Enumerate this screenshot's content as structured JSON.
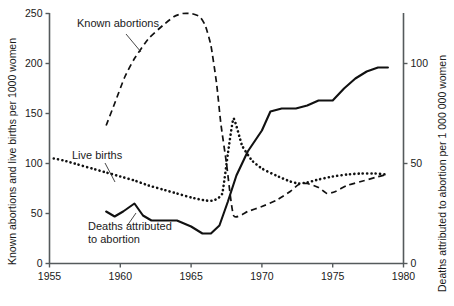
{
  "chart_data": {
    "type": "line",
    "title": "",
    "subtitle": "",
    "xlabel": "",
    "ylabel": "Known abortions and live births per 1000 women",
    "ylabel_right": "Deaths attributed to abortion per 1 000 000 women",
    "xlim": [
      1955,
      1980
    ],
    "ylim": [
      0,
      250
    ],
    "ylim_right": [
      0,
      125
    ],
    "xticks": [
      1955,
      1960,
      1965,
      1970,
      1975,
      1980
    ],
    "xticklabels": [
      "1955",
      "1960",
      "1965",
      "1970",
      "1975",
      "1980"
    ],
    "yticks": [
      0,
      50,
      100,
      150,
      200,
      250
    ],
    "yticklabels": [
      "0",
      "50",
      "100",
      "150",
      "200",
      "250"
    ],
    "yticks_right": [
      0,
      50,
      100
    ],
    "yticklabels_right": [
      "0",
      "50",
      "100"
    ],
    "grid": false,
    "legend_position": "inline-annotations",
    "series": [
      {
        "name": "Known abortions",
        "style": "dashed",
        "axis": "left",
        "label_text": "Known abortions",
        "x": [
          1959.0,
          1959.6,
          1960.3,
          1961.0,
          1962.0,
          1963.0,
          1963.8,
          1964.4,
          1965.0,
          1965.6,
          1966.0,
          1966.4,
          1966.8,
          1967.1,
          1967.5,
          1968.0,
          1969.0,
          1970.0,
          1971.0,
          1972.0,
          1972.6,
          1973.2,
          1974.0,
          1974.6,
          1975.2,
          1976.0,
          1977.0,
          1978.0,
          1978.8
        ],
        "y": [
          138,
          160,
          186,
          205,
          225,
          238,
          247,
          250,
          250,
          247,
          238,
          218,
          180,
          140,
          100,
          48,
          52,
          57,
          63,
          72,
          79,
          80,
          76,
          70,
          72,
          78,
          82,
          86,
          89
        ]
      },
      {
        "name": "Live births",
        "style": "dotted",
        "axis": "left",
        "label_text": "Live births",
        "x": [
          1955.3,
          1956.0,
          1957.0,
          1958.0,
          1959.0,
          1960.0,
          1961.0,
          1962.0,
          1963.0,
          1964.0,
          1965.0,
          1966.0,
          1966.6,
          1967.2,
          1967.6,
          1968.0,
          1968.6,
          1969.3,
          1970.0,
          1971.0,
          1972.0,
          1972.6,
          1973.2,
          1974.0,
          1975.0,
          1976.0,
          1977.0,
          1978.0,
          1978.8
        ],
        "y": [
          105,
          103,
          99,
          95,
          91,
          87,
          83,
          78,
          74,
          70,
          66,
          63,
          63,
          70,
          110,
          145,
          118,
          103,
          95,
          88,
          82,
          80,
          81,
          84,
          87,
          89,
          90,
          90,
          89
        ]
      },
      {
        "name": "Deaths attributed to abortion",
        "style": "solid",
        "axis": "right",
        "label_text": "Deaths attributed to abortion",
        "x": [
          1959.0,
          1959.6,
          1960.2,
          1961.0,
          1961.6,
          1962.2,
          1963.0,
          1964.0,
          1965.0,
          1965.8,
          1966.4,
          1967.0,
          1967.6,
          1968.2,
          1969.0,
          1970.0,
          1970.6,
          1971.4,
          1972.4,
          1973.2,
          1974.0,
          1975.0,
          1975.8,
          1976.6,
          1977.4,
          1978.2,
          1978.9
        ],
        "y_left_units": [
          52,
          47,
          52,
          60,
          48,
          43,
          43,
          43,
          37,
          30,
          30,
          38,
          62,
          88,
          112,
          133,
          152,
          155,
          155,
          158,
          163,
          163,
          175,
          185,
          192,
          196,
          196
        ],
        "y": [
          26.0,
          23.5,
          26.0,
          30.0,
          24.0,
          21.5,
          21.5,
          21.5,
          18.5,
          15.0,
          15.0,
          19.0,
          31.0,
          44.0,
          56.0,
          66.5,
          76.0,
          77.5,
          77.5,
          79.0,
          81.5,
          81.5,
          87.5,
          92.5,
          96.0,
          98.0,
          98.0
        ]
      }
    ],
    "annotations": [
      {
        "text": "Known abortions",
        "x_px": 77,
        "y_px": 27
      },
      {
        "text": "Live births",
        "x_px": 72,
        "y_px": 159
      },
      {
        "text": "Deaths attributed",
        "x_px": 88,
        "y_px": 230
      },
      {
        "text": "to abortion",
        "x_px": 88,
        "y_px": 243
      }
    ]
  },
  "colors": {
    "line": "#111111",
    "axis": "#555a5c",
    "text": "#1a1a1a",
    "background": "#ffffff"
  }
}
